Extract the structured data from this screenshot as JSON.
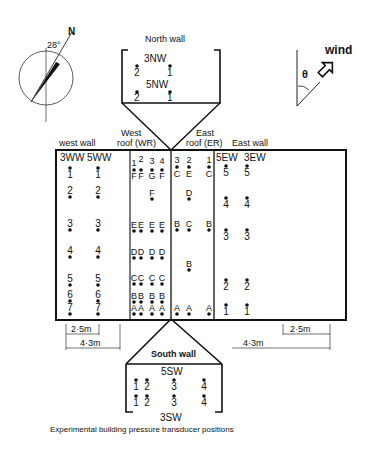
{
  "caption": "Experimental building pressure transducer positions",
  "compass": {
    "north_label": "N",
    "angle_label": "28°",
    "angle_deg": 28
  },
  "wind": {
    "label": "wind",
    "theta_label": "θ"
  },
  "north_wall": {
    "title": "North wall",
    "rows": [
      {
        "label": "3NW",
        "points": [
          "2",
          "1"
        ]
      },
      {
        "label": "5NW",
        "points": [
          "2",
          "1"
        ]
      }
    ]
  },
  "south_wall": {
    "title": "South wall",
    "top_label": "5SW",
    "bottom_label": "3SW",
    "rows": [
      {
        "points": [
          "1",
          "2",
          "3",
          "4"
        ]
      },
      {
        "points": [
          "1",
          "2",
          "3",
          "4"
        ]
      }
    ]
  },
  "section_labels": {
    "west_wall": "west wall",
    "west_roof_1": "West",
    "west_roof_2": "roof (WR)",
    "east_roof_1": "East",
    "east_roof_2": "roof (ER)",
    "east_wall": "East wall"
  },
  "west_wall": {
    "column_labels": [
      "3WW",
      "5WW"
    ],
    "rows": [
      "1",
      "2",
      "3",
      "4",
      "5",
      "6",
      "7"
    ]
  },
  "west_roof": {
    "column_numbers": [
      "1",
      "2",
      "3",
      "4"
    ],
    "cells": [
      [
        "F",
        "F",
        "G",
        "F"
      ],
      [
        "",
        "",
        "F",
        ""
      ],
      [
        "E",
        "E",
        "E",
        "E"
      ],
      [
        "D",
        "D",
        "D",
        "D"
      ],
      [
        "C",
        "C",
        "C",
        "C"
      ],
      [
        "B",
        "B",
        "B",
        "B"
      ],
      [
        "A",
        "A",
        "A",
        "A"
      ]
    ]
  },
  "east_roof": {
    "column_numbers": [
      "3",
      "2",
      "1"
    ],
    "cells": [
      [
        "C",
        "E",
        "C"
      ],
      [
        "",
        "D",
        ""
      ],
      [
        "B",
        "C",
        "B"
      ],
      [
        "",
        "B",
        ""
      ],
      [
        "A",
        "A",
        "A"
      ]
    ]
  },
  "east_wall": {
    "column_labels": [
      "5EW",
      "3EW"
    ],
    "rows": [
      "5",
      "4",
      "3",
      "2",
      "1"
    ]
  },
  "dimensions": {
    "west_inner": "2·5m",
    "west_outer": "4·3m",
    "east_inner": "2·5m",
    "east_outer": "4·3m"
  }
}
